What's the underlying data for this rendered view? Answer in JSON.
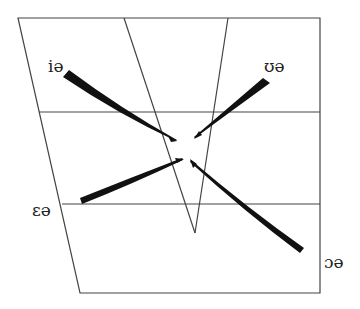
{
  "diagram": {
    "colors": {
      "grid": "#444444",
      "arrow": "#111111",
      "text": "#222222",
      "background": "#ffffff"
    },
    "labels": [
      {
        "id": "ie",
        "text": "iə",
        "x": 48,
        "y": 58
      },
      {
        "id": "ue",
        "text": "ʊə",
        "x": 264,
        "y": 58
      },
      {
        "id": "ee",
        "text": "ɛə",
        "x": 32,
        "y": 202
      },
      {
        "id": "oe",
        "text": "ɔə",
        "x": 324,
        "y": 254
      }
    ],
    "arrows": [
      {
        "from": "iə",
        "to": "ə (central)"
      },
      {
        "from": "ʊə",
        "to": "ə (central)"
      },
      {
        "from": "ɛə",
        "to": "ə (central)"
      },
      {
        "from": "ɔə",
        "to": "ə (central)"
      }
    ]
  }
}
